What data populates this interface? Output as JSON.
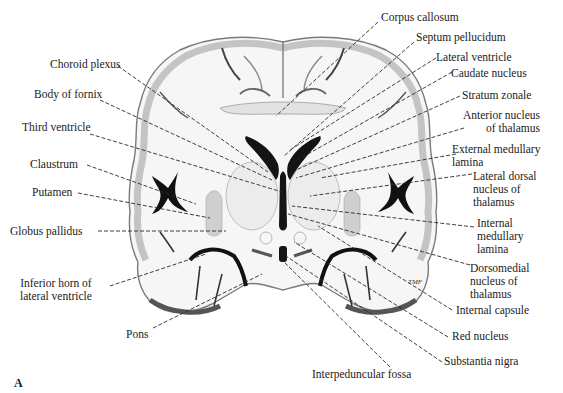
{
  "figure": {
    "panel_letter": "A",
    "colors": {
      "background": "#ffffff",
      "cortex_gray": "#b8b8b8",
      "white_matter": "#f4f4f4",
      "ventricle": "#141414",
      "nucleus_gray": "#d6d6d6",
      "text": "#1b1b1b"
    },
    "labels_left": [
      {
        "id": "choroid-plexus",
        "text": "Choroid plexus"
      },
      {
        "id": "body-of-fornix",
        "text": "Body of fornix"
      },
      {
        "id": "third-ventricle",
        "text": "Third ventricle"
      },
      {
        "id": "claustrum",
        "text": "Claustrum"
      },
      {
        "id": "putamen",
        "text": "Putamen"
      },
      {
        "id": "globus-pallidus",
        "text": "Globus pallidus"
      },
      {
        "id": "inferior-horn",
        "text": "Inferior horn of\nlateral ventricle"
      },
      {
        "id": "pons",
        "text": "Pons"
      }
    ],
    "labels_right": [
      {
        "id": "corpus-callosum",
        "text": "Corpus callosum"
      },
      {
        "id": "septum-pellucidum",
        "text": "Septum pellucidum"
      },
      {
        "id": "lateral-ventricle",
        "text": "Lateral ventricle"
      },
      {
        "id": "caudate-nucleus",
        "text": "Caudate nucleus"
      },
      {
        "id": "stratum-zonale",
        "text": "Stratum zonale"
      },
      {
        "id": "anterior-nucleus",
        "text": "Anterior nucleus\nof thalamus"
      },
      {
        "id": "external-medullary-lamina",
        "text": "External medullary\nlamina"
      },
      {
        "id": "lateral-dorsal-nucleus",
        "text": "Lateral dorsal\nnucleus of\nthalamus"
      },
      {
        "id": "internal-medullary-lamina",
        "text": "Internal\nmedullary\nlamina"
      },
      {
        "id": "dorsomedial-nucleus",
        "text": "Dorsomedial\nnucleus of\nthalamus"
      },
      {
        "id": "internal-capsule",
        "text": "Internal capsule"
      },
      {
        "id": "red-nucleus",
        "text": "Red nucleus"
      },
      {
        "id": "substantia-nigra",
        "text": "Substantia nigra"
      }
    ],
    "labels_bottom": [
      {
        "id": "interpeduncular-fossa",
        "text": "Interpeduncular fossa"
      }
    ],
    "signature": "TMF"
  }
}
